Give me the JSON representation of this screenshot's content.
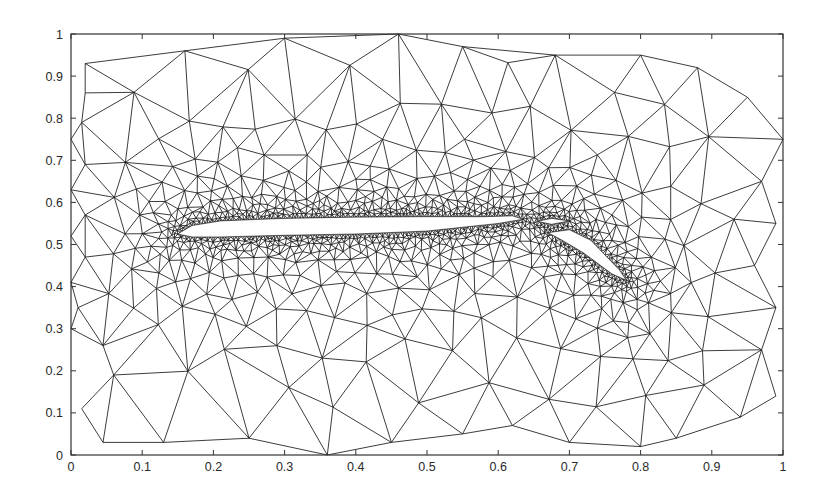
{
  "chart_data": {
    "type": "mesh",
    "title": "",
    "xlabel": "",
    "ylabel": "",
    "xlim": [
      0,
      1
    ],
    "ylim": [
      0,
      1
    ],
    "grid": false,
    "legend": null,
    "x_ticks": [
      0,
      0.1,
      0.2,
      0.3,
      0.4,
      0.5,
      0.6,
      0.7,
      0.8,
      0.9,
      1
    ],
    "x_tick_labels": [
      "0",
      "0.1",
      "0.2",
      "0.3",
      "0.4",
      "0.5",
      "0.6",
      "0.7",
      "0.8",
      "0.9",
      "1"
    ],
    "y_ticks": [
      0,
      0.1,
      0.2,
      0.3,
      0.4,
      0.5,
      0.6,
      0.7,
      0.8,
      0.9,
      1
    ],
    "y_tick_labels": [
      "0",
      "0.1",
      "0.2",
      "0.3",
      "0.4",
      "0.5",
      "0.6",
      "0.7",
      "0.8",
      "0.9",
      "1"
    ],
    "line_color": "#1a1a1a",
    "background_color": "#ffffff",
    "outer_boundary": [
      [
        0.02,
        0.93
      ],
      [
        0.16,
        0.96
      ],
      [
        0.3,
        0.99
      ],
      [
        0.46,
        1.0
      ],
      [
        0.55,
        0.97
      ],
      [
        0.68,
        0.95
      ],
      [
        0.8,
        0.95
      ],
      [
        0.88,
        0.92
      ],
      [
        0.95,
        0.85
      ],
      [
        1.0,
        0.75
      ],
      [
        0.97,
        0.65
      ],
      [
        0.99,
        0.55
      ],
      [
        0.96,
        0.45
      ],
      [
        0.99,
        0.35
      ],
      [
        0.97,
        0.25
      ],
      [
        0.99,
        0.14
      ],
      [
        0.94,
        0.09
      ],
      [
        0.85,
        0.04
      ],
      [
        0.8,
        0.02
      ],
      [
        0.7,
        0.03
      ],
      [
        0.62,
        0.07
      ],
      [
        0.55,
        0.05
      ],
      [
        0.45,
        0.03
      ],
      [
        0.36,
        0.0
      ],
      [
        0.25,
        0.04
      ],
      [
        0.13,
        0.03
      ],
      [
        0.045,
        0.03
      ],
      [
        0.015,
        0.11
      ],
      [
        0.06,
        0.19
      ],
      [
        0.045,
        0.26
      ],
      [
        0.0,
        0.3
      ],
      [
        0.01,
        0.35
      ],
      [
        0.0,
        0.41
      ],
      [
        0.02,
        0.47
      ],
      [
        0.0,
        0.52
      ],
      [
        0.02,
        0.57
      ],
      [
        0.0,
        0.63
      ],
      [
        0.02,
        0.69
      ],
      [
        0.0,
        0.75
      ],
      [
        0.015,
        0.79
      ],
      [
        0.02,
        0.86
      ]
    ],
    "main_element": [
      [
        0.15,
        0.525
      ],
      [
        0.17,
        0.545
      ],
      [
        0.21,
        0.556
      ],
      [
        0.3,
        0.562
      ],
      [
        0.4,
        0.565
      ],
      [
        0.5,
        0.566
      ],
      [
        0.58,
        0.566
      ],
      [
        0.62,
        0.568
      ],
      [
        0.635,
        0.56
      ],
      [
        0.6,
        0.55
      ],
      [
        0.5,
        0.532
      ],
      [
        0.4,
        0.525
      ],
      [
        0.3,
        0.522
      ],
      [
        0.21,
        0.518
      ],
      [
        0.17,
        0.518
      ]
    ],
    "vane_element": [
      [
        0.655,
        0.555
      ],
      [
        0.675,
        0.562
      ],
      [
        0.7,
        0.556
      ],
      [
        0.675,
        0.548
      ]
    ],
    "flap_element": [
      [
        0.67,
        0.528
      ],
      [
        0.7,
        0.535
      ],
      [
        0.73,
        0.51
      ],
      [
        0.77,
        0.44
      ],
      [
        0.78,
        0.415
      ],
      [
        0.76,
        0.43
      ],
      [
        0.72,
        0.48
      ],
      [
        0.69,
        0.51
      ]
    ],
    "refinement_centers": [
      [
        0.15,
        0.53
      ],
      [
        0.63,
        0.56
      ],
      [
        0.76,
        0.42
      ],
      [
        0.4,
        0.545
      ]
    ]
  }
}
